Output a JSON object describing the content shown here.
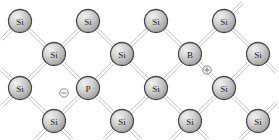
{
  "figure": {
    "background_color": "#ffffff",
    "bond_color": "#b9b9b9",
    "atom_fill_light": "#e8e8e8",
    "atom_fill_dark": "#9a9a9a",
    "atom_border_color": "#4a4a4a",
    "label_color": "#1a1a1a",
    "atom_radius": 11.5,
    "charge_radius": 4.2
  },
  "atoms": [
    {
      "id": "a-r1c1",
      "label": "Si",
      "element": "silicon",
      "x": 20,
      "y": 21,
      "name": "atom-si-r1c1"
    },
    {
      "id": "a-r1c2",
      "label": "Si",
      "element": "silicon",
      "x": 88,
      "y": 21,
      "name": "atom-si-r1c2"
    },
    {
      "id": "a-r1c3",
      "label": "Si",
      "element": "silicon",
      "x": 156,
      "y": 21,
      "name": "atom-si-r1c3"
    },
    {
      "id": "a-r1c4",
      "label": "Si",
      "element": "silicon",
      "x": 224,
      "y": 21,
      "name": "atom-si-r1c4"
    },
    {
      "id": "a-r2c1",
      "label": "Si",
      "element": "silicon",
      "x": 54,
      "y": 54,
      "name": "atom-si-r2c1"
    },
    {
      "id": "a-r2c2",
      "label": "Si",
      "element": "silicon",
      "x": 122,
      "y": 54,
      "name": "atom-si-r2c2"
    },
    {
      "id": "a-r2c3",
      "label": "B",
      "element": "boron",
      "x": 190,
      "y": 54,
      "name": "atom-b-acceptor"
    },
    {
      "id": "a-r2c4",
      "label": "Si",
      "element": "silicon",
      "x": 258,
      "y": 54,
      "name": "atom-si-r2c4"
    },
    {
      "id": "a-r3c1",
      "label": "Si",
      "element": "silicon",
      "x": 20,
      "y": 88,
      "name": "atom-si-r3c1"
    },
    {
      "id": "a-r3c2",
      "label": "P",
      "element": "phosphorus",
      "x": 88,
      "y": 88,
      "name": "atom-p-donor"
    },
    {
      "id": "a-r3c3",
      "label": "Si",
      "element": "silicon",
      "x": 156,
      "y": 88,
      "name": "atom-si-r3c3"
    },
    {
      "id": "a-r3c4",
      "label": "Si",
      "element": "silicon",
      "x": 224,
      "y": 88,
      "name": "atom-si-r3c4"
    },
    {
      "id": "a-r4c1",
      "label": "Si",
      "element": "silicon",
      "x": 54,
      "y": 121,
      "name": "atom-si-r4c1"
    },
    {
      "id": "a-r4c2",
      "label": "Si",
      "element": "silicon",
      "x": 122,
      "y": 121,
      "name": "atom-si-r4c2"
    },
    {
      "id": "a-r4c3",
      "label": "Si",
      "element": "silicon",
      "x": 190,
      "y": 121,
      "name": "atom-si-r4c3"
    },
    {
      "id": "a-r4c4",
      "label": "Si",
      "element": "silicon",
      "x": 258,
      "y": 121,
      "name": "atom-si-r4c4"
    }
  ],
  "bonds": [
    {
      "from": "a-r1c1",
      "to": "a-r2c1",
      "name": "bond-r1c1-r2c1"
    },
    {
      "from": "a-r1c2",
      "to": "a-r2c1",
      "name": "bond-r1c2-r2c1"
    },
    {
      "from": "a-r1c2",
      "to": "a-r2c2",
      "name": "bond-r1c2-r2c2"
    },
    {
      "from": "a-r1c3",
      "to": "a-r2c2",
      "name": "bond-r1c3-r2c2"
    },
    {
      "from": "a-r1c3",
      "to": "a-r2c3",
      "name": "bond-r1c3-r2c3"
    },
    {
      "from": "a-r1c4",
      "to": "a-r2c3",
      "name": "bond-r1c4-r2c3"
    },
    {
      "from": "a-r1c4",
      "to": "a-r2c4",
      "name": "bond-r1c4-r2c4"
    },
    {
      "from": "a-r2c1",
      "to": "a-r3c1",
      "name": "bond-r2c1-r3c1"
    },
    {
      "from": "a-r2c1",
      "to": "a-r3c2",
      "name": "bond-r2c1-r3c2"
    },
    {
      "from": "a-r2c2",
      "to": "a-r3c2",
      "name": "bond-r2c2-r3c2"
    },
    {
      "from": "a-r2c2",
      "to": "a-r3c3",
      "name": "bond-r2c2-r3c3"
    },
    {
      "from": "a-r2c3",
      "to": "a-r3c3",
      "name": "bond-r2c3-r3c3"
    },
    {
      "from": "a-r2c3",
      "to": "a-r3c4",
      "name": "bond-r2c3-r3c4"
    },
    {
      "from": "a-r2c4",
      "to": "a-r3c4",
      "name": "bond-r2c4-r3c4"
    },
    {
      "from": "a-r3c1",
      "to": "a-r4c1",
      "name": "bond-r3c1-r4c1"
    },
    {
      "from": "a-r3c2",
      "to": "a-r4c1",
      "name": "bond-r3c2-r4c1"
    },
    {
      "from": "a-r3c2",
      "to": "a-r4c2",
      "name": "bond-r3c2-r4c2"
    },
    {
      "from": "a-r3c3",
      "to": "a-r4c2",
      "name": "bond-r3c3-r4c2"
    },
    {
      "from": "a-r3c3",
      "to": "a-r4c3",
      "name": "bond-r3c3-r4c3"
    },
    {
      "from": "a-r3c4",
      "to": "a-r4c3",
      "name": "bond-r3c4-r4c3"
    },
    {
      "from": "a-r3c4",
      "to": "a-r4c4",
      "name": "bond-r3c4-r4c4"
    }
  ],
  "edge_stubs": [
    {
      "from": "a-r1c1",
      "dx": -1,
      "dy": 1,
      "name": "stub-r1c1-down-left"
    },
    {
      "from": "a-r1c4",
      "dx": 1,
      "dy": -1,
      "name": "stub-r1c4-up-right"
    },
    {
      "from": "a-r2c4",
      "dx": 1,
      "dy": 1,
      "name": "stub-r2c4-down-right"
    },
    {
      "from": "a-r3c1",
      "dx": -1,
      "dy": -1,
      "name": "stub-r3c1-up-left"
    },
    {
      "from": "a-r3c1",
      "dx": -1,
      "dy": 1,
      "name": "stub-r3c1-down-left"
    },
    {
      "from": "a-r4c4",
      "dx": 1,
      "dy": -1,
      "name": "stub-r4c4-up-right"
    },
    {
      "from": "a-r4c1",
      "dx": -1,
      "dy": 1,
      "name": "stub-r4c1-down-left"
    },
    {
      "from": "a-r4c2",
      "dx": -1,
      "dy": 1,
      "name": "stub-r4c2-down-left"
    },
    {
      "from": "a-r4c3",
      "dx": -1,
      "dy": 1,
      "name": "stub-r4c3-down-left"
    },
    {
      "from": "a-r4c4",
      "dx": -1,
      "dy": 1,
      "name": "stub-r4c4-down-left"
    },
    {
      "from": "a-r4c1",
      "dx": 1,
      "dy": 1,
      "name": "stub-r4c1-down-right"
    },
    {
      "from": "a-r4c2",
      "dx": 1,
      "dy": 1,
      "name": "stub-r4c2-down-right"
    },
    {
      "from": "a-r4c3",
      "dx": 1,
      "dy": 1,
      "name": "stub-r4c3-down-right"
    }
  ],
  "charges": [
    {
      "id": "charge-negative",
      "symbol": "minus",
      "sign": "−",
      "meaning": "ionized donor negative charge near phosphorus",
      "x": 64,
      "y": 93,
      "name": "charge-symbol-negative"
    },
    {
      "id": "charge-positive",
      "symbol": "plus",
      "sign": "+",
      "meaning": "hole positive charge near boron",
      "x": 207,
      "y": 70,
      "name": "charge-symbol-positive"
    }
  ]
}
